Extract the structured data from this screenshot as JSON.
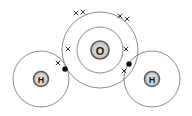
{
  "diagram": {
    "molecule_formula": "H2O",
    "background_color": "#ffffff",
    "shell_stroke_color": "#6e6e6e",
    "nucleus_fill_color": "#c9c9c9",
    "nucleus_ring_color": "#5a5a5a",
    "electron_cross_color": "#1c1c1c",
    "electron_dot_color": "#101010",
    "atoms": [
      {
        "id": "oxygen",
        "label": "O",
        "cx": 100,
        "cy": 50,
        "nucleus_radius": 9,
        "shells": [
          {
            "name": "inner-shell",
            "radius": 23
          },
          {
            "name": "outer-shell",
            "radius": 38
          }
        ]
      },
      {
        "id": "hydrogen-left",
        "label": "H",
        "cx": 41,
        "cy": 79,
        "nucleus_radius": 7,
        "shells": [
          {
            "name": "shell",
            "radius": 28
          }
        ]
      },
      {
        "id": "hydrogen-right",
        "label": "H",
        "cx": 152,
        "cy": 79,
        "nucleus_radius": 7,
        "shells": [
          {
            "name": "shell",
            "radius": 28
          }
        ]
      }
    ],
    "electrons": [
      {
        "name": "oxygen-lone-pair-top-left-cross-a",
        "type": "cross",
        "x": 76,
        "y": 13,
        "size": 4.0
      },
      {
        "name": "oxygen-lone-pair-top-left-cross-b",
        "type": "cross",
        "x": 83,
        "y": 12,
        "size": 4.0
      },
      {
        "name": "oxygen-lone-pair-top-right-cross-a",
        "type": "cross",
        "x": 120,
        "y": 16,
        "size": 4.0
      },
      {
        "name": "oxygen-lone-pair-top-right-cross-b",
        "type": "cross",
        "x": 127,
        "y": 19,
        "size": 4.0
      },
      {
        "name": "oxygen-inner-shell-cross-left",
        "type": "cross",
        "x": 68,
        "y": 49,
        "size": 4.0
      },
      {
        "name": "oxygen-inner-shell-cross-right",
        "type": "cross",
        "x": 126,
        "y": 49,
        "size": 4.0
      },
      {
        "name": "bonding-pair-left-cross",
        "type": "cross",
        "x": 58,
        "y": 63,
        "size": 4.0
      },
      {
        "name": "bonding-pair-left-dot",
        "type": "dot",
        "x": 65,
        "y": 69,
        "radius": 2.6
      },
      {
        "name": "bonding-pair-right-dot",
        "type": "dot",
        "x": 129,
        "y": 64,
        "radius": 2.6
      },
      {
        "name": "bonding-pair-right-cross",
        "type": "cross",
        "x": 124,
        "y": 71,
        "size": 4.0
      }
    ]
  }
}
